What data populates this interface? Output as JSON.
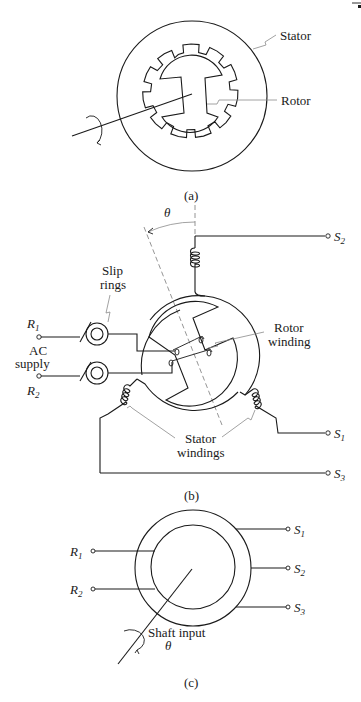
{
  "figure_a": {
    "caption": "(a)",
    "labels": {
      "stator": "Stator",
      "rotor": "Rotor"
    }
  },
  "figure_b": {
    "caption": "(b)",
    "angle_symbol": "θ",
    "labels": {
      "slip_rings_line1": "Slip",
      "slip_rings_line2": "rings",
      "rotor_winding_line1": "Rotor",
      "rotor_winding_line2": "winding",
      "ac_supply_line1": "AC",
      "ac_supply_line2": "supply",
      "stator_windings_line1": "Stator",
      "stator_windings_line2": "windings"
    },
    "terminals": {
      "r1": {
        "main": "R",
        "sub": "1"
      },
      "r2": {
        "main": "R",
        "sub": "2"
      },
      "s1": {
        "main": "S",
        "sub": "1"
      },
      "s2": {
        "main": "S",
        "sub": "2"
      },
      "s3": {
        "main": "S",
        "sub": "3"
      }
    }
  },
  "figure_c": {
    "caption": "(c)",
    "labels": {
      "shaft_input": "Shaft input",
      "angle_symbol": "θ"
    },
    "terminals": {
      "r1": {
        "main": "R",
        "sub": "1"
      },
      "r2": {
        "main": "R",
        "sub": "2"
      },
      "s1": {
        "main": "S",
        "sub": "1"
      },
      "s2": {
        "main": "S",
        "sub": "2"
      },
      "s3": {
        "main": "S",
        "sub": "3"
      }
    }
  }
}
